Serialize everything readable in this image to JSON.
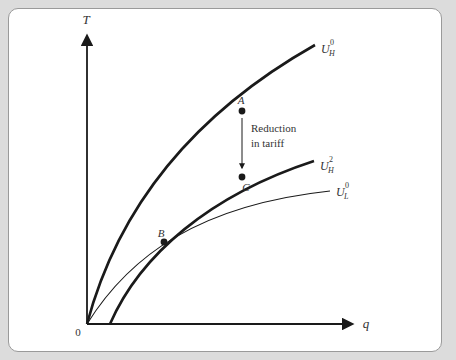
{
  "diagram": {
    "axes": {
      "y_label": "T",
      "x_label": "q",
      "origin_label": "0"
    },
    "curves": [
      {
        "id": "UH0",
        "label_base": "U",
        "label_sub": "H",
        "label_sup": "0",
        "weight": "thick"
      },
      {
        "id": "UH2",
        "label_base": "U",
        "label_sub": "H",
        "label_sup": "2",
        "weight": "thick"
      },
      {
        "id": "UL0",
        "label_base": "U",
        "label_sub": "L",
        "label_sup": "0",
        "weight": "thin"
      }
    ],
    "points": [
      {
        "label": "A"
      },
      {
        "label": "B"
      },
      {
        "label": "C"
      }
    ],
    "annotation": {
      "line1": "Reduction",
      "line2": "in tariff"
    },
    "colors": {
      "background": "#dcdcdc",
      "panel": "#ffffff",
      "ink": "#1a1a1a"
    }
  }
}
